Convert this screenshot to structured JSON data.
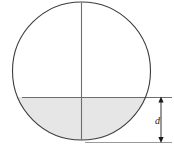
{
  "figure": {
    "type": "geometric-diagram",
    "labels": {
      "depth": "d"
    },
    "colors": {
      "outline": "#3c3c3c",
      "shading": "#e6e6e6",
      "chord_line": "#6e6e6e",
      "diameter_line": "#6e6e6e",
      "dimension_line": "#1a1a1a",
      "extension_line": "#9a9a9a",
      "background": "#ffffff"
    },
    "geometry": {
      "circle_center_x": 81.5,
      "circle_center_y": 71,
      "circle_radius": 69,
      "chord_y": 97,
      "circle_bottom_y": 140,
      "dimension_line_x": 161,
      "dimension_top_y": 97,
      "dimension_bottom_y": 142
    }
  }
}
